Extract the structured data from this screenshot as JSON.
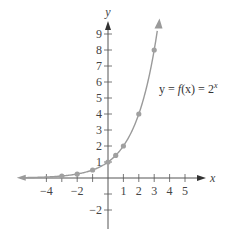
{
  "chart_data": {
    "type": "line",
    "title": "",
    "xlabel": "x",
    "ylabel": "y",
    "function_label": "y = f(x) = 2^x",
    "function_label_parts": {
      "lhs": "y = ",
      "f": "f",
      "arg": "(x) = 2",
      "exp": "x"
    },
    "xlim": [
      -5.5,
      6
    ],
    "ylim": [
      -3,
      10
    ],
    "x_ticks": [
      -4,
      -3,
      -2,
      -1,
      0,
      1,
      2,
      3,
      4,
      5
    ],
    "x_tick_labels": [
      "−4",
      "−2",
      "1",
      "2",
      "3",
      "4",
      "5"
    ],
    "x_tick_label_values": [
      -4,
      -2,
      1,
      2,
      3,
      4,
      5
    ],
    "y_ticks": [
      -2,
      -1,
      1,
      2,
      3,
      4,
      5,
      6,
      7,
      8,
      9
    ],
    "y_tick_labels": [
      "1",
      "2",
      "3",
      "4",
      "5",
      "6",
      "7",
      "8",
      "9",
      "−2"
    ],
    "y_tick_label_values": [
      1,
      2,
      3,
      4,
      5,
      6,
      7,
      8,
      9,
      -2
    ],
    "grid": false,
    "series": [
      {
        "name": "2^x",
        "points": [
          {
            "x": -3,
            "y": 0.125
          },
          {
            "x": -2,
            "y": 0.25
          },
          {
            "x": -1,
            "y": 0.5
          },
          {
            "x": 0,
            "y": 1
          },
          {
            "x": 0.5,
            "y": 1.414
          },
          {
            "x": 1,
            "y": 2
          },
          {
            "x": 2,
            "y": 4
          },
          {
            "x": 3,
            "y": 8
          }
        ]
      }
    ],
    "colors": {
      "curve": "#9a9a9a",
      "axes": "#555555",
      "points": "#a0a0a0"
    }
  }
}
